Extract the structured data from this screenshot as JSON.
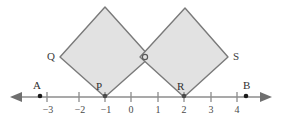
{
  "figure": {
    "background_color": "#ffffff",
    "shape_fill": "#e2e2e2",
    "shape_stroke": "#7a7a7a",
    "axis_color": "#8c8c8c",
    "label_color": "#3a3a3a"
  },
  "number_line": {
    "y_position": 97,
    "unit_px": 26.5,
    "origin_x": 131,
    "left_arrow": true,
    "right_arrow": true,
    "ticks": [
      {
        "value": -3,
        "label": "−3",
        "x": 47
      },
      {
        "value": -2,
        "label": "−2",
        "x": 79
      },
      {
        "value": -1,
        "label": "−1",
        "x": 105
      },
      {
        "value": 0,
        "label": "0",
        "x": 131
      },
      {
        "value": 1,
        "label": "1",
        "x": 158
      },
      {
        "value": 2,
        "label": "2",
        "x": 184
      },
      {
        "value": 3,
        "label": "3",
        "x": 211
      },
      {
        "value": 4,
        "label": "4",
        "x": 237
      }
    ]
  },
  "marked_points": [
    {
      "name": "A",
      "label": "A",
      "x": 40,
      "y": 97,
      "label_x": 33,
      "label_y": 80
    },
    {
      "name": "B",
      "label": "B",
      "x": 246,
      "y": 97,
      "label_x": 243,
      "label_y": 80
    },
    {
      "name": "P",
      "label": "P",
      "x": 105,
      "y": 97,
      "label_x": 96,
      "label_y": 82
    },
    {
      "name": "R",
      "label": "R",
      "x": 184,
      "y": 97,
      "label_x": 176,
      "label_y": 82
    },
    {
      "name": "Q",
      "label": "Q",
      "x": 60,
      "y": 57,
      "label_x": 47,
      "label_y": 51
    },
    {
      "name": "S",
      "label": "S",
      "x": 228,
      "y": 57,
      "label_x": 233,
      "label_y": 51
    }
  ],
  "squares": [
    {
      "name": "left-square",
      "vertices": "105,97 60,57 105,7 150,57",
      "bottom_vertex": "P",
      "left_vertex": "Q",
      "top_vertex": "",
      "right_vertex": "intersection"
    },
    {
      "name": "right-square",
      "vertices": "184,97 140,57 185,8 228,57",
      "bottom_vertex": "R",
      "left_vertex": "intersection",
      "top_vertex": "",
      "right_vertex": "S"
    }
  ],
  "intersection_marker": {
    "name": "squares-intersection-point",
    "x": 145,
    "y": 57,
    "radius": 2.6
  }
}
